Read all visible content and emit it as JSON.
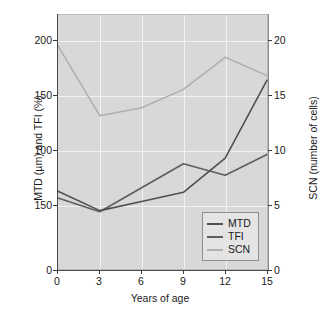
{
  "chart_data": {
    "type": "line",
    "title": "",
    "xlabel": "Years of age",
    "ylabel": "MTD (µm) and TFI (%)",
    "ylabel_right": "SCN (number of cells)",
    "x": [
      0,
      3,
      6,
      9,
      12,
      15
    ],
    "xticklabels": [
      "0",
      "3",
      "6",
      "9",
      "12",
      "15"
    ],
    "xlim": [
      0,
      15
    ],
    "ylim": [
      0,
      222
    ],
    "yticks": [
      0,
      50,
      100,
      150,
      200
    ],
    "yticklabels": [
      "0",
      "150",
      "100",
      "150",
      "200"
    ],
    "ylim_right": [
      0,
      22.2
    ],
    "yticks_right": [
      0,
      5,
      10,
      15,
      20
    ],
    "yticklabels_right": [
      "0",
      "5",
      "10",
      "15",
      "20"
    ],
    "grid": true,
    "legend_position": "lower right",
    "series": [
      {
        "name": "MTD",
        "axis": "left",
        "color": "#4f4f4f",
        "values": [
          68,
          51,
          59,
          67,
          97,
          165
        ]
      },
      {
        "name": "TFI",
        "axis": "left",
        "color": "#5e5e5e",
        "values": [
          62,
          50,
          71,
          92,
          82,
          100
        ]
      },
      {
        "name": "SCN",
        "axis": "right",
        "color": "#b0b0b0",
        "values": [
          19.5,
          13.4,
          14.1,
          15.7,
          18.5,
          16.9
        ]
      }
    ]
  },
  "legend": {
    "items": [
      {
        "label": "MTD"
      },
      {
        "label": "TFI"
      },
      {
        "label": "SCN"
      }
    ]
  },
  "colors": {
    "panel_background": "#d8d8d8",
    "grid": "#f2f2f2",
    "axis": "#3a3a3a",
    "text": "#1a1a1a"
  }
}
